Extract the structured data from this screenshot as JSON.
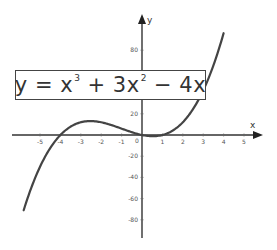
{
  "equation": {
    "lhs": "y = x",
    "exp1": "3",
    "mid": " + 3x",
    "exp2": "2",
    "rhs": " − 4x"
  },
  "chart_data": {
    "type": "line",
    "xlabel": "x",
    "ylabel": "y",
    "xlim": [
      -6,
      6
    ],
    "ylim": [
      -95,
      110
    ],
    "x_ticks": [
      -5,
      -4,
      -3,
      -2,
      -1,
      0,
      1,
      2,
      3,
      4,
      5
    ],
    "x_tick_labels": [
      "-5",
      "-4",
      "-3",
      "-2",
      "-1",
      "0",
      "1",
      "2",
      "3",
      "4",
      "5"
    ],
    "y_ticks": [
      80,
      20,
      -20,
      -40,
      -60,
      -80
    ],
    "y_tick_labels": [
      "80",
      "20",
      "-20",
      "-40",
      "-60",
      "-80"
    ],
    "grid": false,
    "legend": "none",
    "series": [
      {
        "name": "y = x^3 + 3x^2 - 4x",
        "color": "#444444",
        "x": [
          -5.8,
          -5,
          -4,
          -3,
          -2.5,
          -2,
          -1,
          0,
          0.5,
          1,
          2,
          3,
          4
        ],
        "y": [
          -79.4,
          -30,
          0,
          12,
          13.1,
          12,
          6,
          0,
          -1.1,
          0,
          12,
          42,
          96
        ]
      }
    ],
    "annotations": [
      "y = x^3 + 3x^2 - 4x"
    ]
  }
}
